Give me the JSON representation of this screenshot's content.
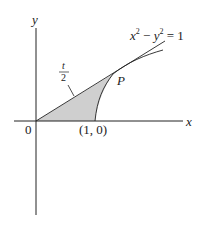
{
  "diagram": {
    "title": "",
    "equation": "x² − y² = 1",
    "equation_parts": {
      "x": "x",
      "exp1": "2",
      "minus": " − ",
      "y": "y",
      "exp2": "2",
      "rhs": " = 1"
    },
    "axes": {
      "x_label": "x",
      "y_label": "y",
      "origin_label": "0"
    },
    "vertex_label": "(1, 0)",
    "point_label": "P",
    "area_label": {
      "numerator": "t",
      "denominator": "2"
    },
    "colors": {
      "shade": "#cfcfcf",
      "line": "#222222"
    }
  }
}
